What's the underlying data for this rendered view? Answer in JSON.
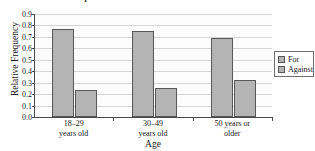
{
  "chart_data": {
    "type": "bar",
    "title": "Opinions on Health Care",
    "title_clipped": true,
    "xlabel": "Age",
    "ylabel": "Relative Frequency",
    "categories": [
      "18–29\nyears old",
      "30–49\nyears old",
      "50 years or\nolder"
    ],
    "category_lines": [
      [
        "18–29",
        "years old"
      ],
      [
        "30–49",
        "years old"
      ],
      [
        "50 years or",
        "older"
      ]
    ],
    "series": [
      {
        "name": "For",
        "values": [
          0.77,
          0.755,
          0.69
        ]
      },
      {
        "name": "Against",
        "values": [
          0.24,
          0.255,
          0.32
        ]
      }
    ],
    "ylim": [
      0.0,
      0.9
    ],
    "ytick_labels": [
      "0.0",
      "0.1",
      "0.2",
      "0.3",
      "0.4",
      "0.5",
      "0.6",
      "0.7",
      "0.8",
      "0.9"
    ],
    "ytick_values": [
      0.0,
      0.1,
      0.2,
      0.3,
      0.4,
      0.5,
      0.6,
      0.7,
      0.8,
      0.9
    ],
    "grid": true,
    "grid_axis": "y",
    "legend_position": "right",
    "legend_entries": [
      "For",
      "Against"
    ],
    "colors": {
      "bar_fill": "#b4b4b4",
      "bar_border": "#585858",
      "gridline": "#d6d6d6",
      "axis": "#4a4a4a",
      "plot_background": "#fcfcfc",
      "page_background": "#ffffff",
      "text": "#1a1a1a"
    }
  }
}
